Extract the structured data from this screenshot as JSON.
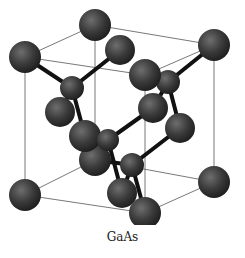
{
  "diagram": {
    "title": "GaAs",
    "type": "crystal-structure",
    "structure": "zinc blende unit cell",
    "colors": {
      "atom": "#3a3a3a",
      "atom_highlight": "#6e6e6e",
      "bond": "#111111",
      "cell_edge": "#555555",
      "background": "#ffffff"
    },
    "cell_edges": [
      [
        25,
        57,
        95,
        25
      ],
      [
        95,
        25,
        214,
        45
      ],
      [
        214,
        45,
        145,
        75
      ],
      [
        25,
        57,
        145,
        75
      ],
      [
        25,
        195,
        145,
        213
      ],
      [
        145,
        213,
        214,
        182
      ],
      [
        214,
        182,
        95,
        160
      ],
      [
        95,
        160,
        25,
        195
      ],
      [
        25,
        57,
        25,
        195
      ],
      [
        95,
        25,
        95,
        160
      ],
      [
        214,
        45,
        214,
        182
      ],
      [
        145,
        75,
        145,
        213
      ]
    ],
    "bonds": [
      [
        25,
        57,
        72,
        88
      ],
      [
        120,
        50,
        72,
        88
      ],
      [
        60,
        112,
        72,
        88
      ],
      [
        85,
        136,
        72,
        88
      ],
      [
        214,
        45,
        168,
        82
      ],
      [
        145,
        75,
        168,
        82
      ],
      [
        180,
        128,
        168,
        82
      ],
      [
        153,
        108,
        168,
        82
      ],
      [
        85,
        136,
        108,
        140
      ],
      [
        153,
        108,
        108,
        140
      ],
      [
        95,
        160,
        108,
        140
      ],
      [
        122,
        193,
        108,
        140
      ],
      [
        180,
        128,
        132,
        165
      ],
      [
        122,
        193,
        132,
        165
      ],
      [
        145,
        213,
        132,
        165
      ],
      [
        95,
        160,
        132,
        165
      ]
    ],
    "atoms": [
      {
        "x": 95,
        "y": 25,
        "r": 16
      },
      {
        "x": 214,
        "y": 45,
        "r": 16
      },
      {
        "x": 25,
        "y": 57,
        "r": 16
      },
      {
        "x": 120,
        "y": 50,
        "r": 15
      },
      {
        "x": 168,
        "y": 82,
        "r": 12
      },
      {
        "x": 72,
        "y": 88,
        "r": 12
      },
      {
        "x": 145,
        "y": 75,
        "r": 16
      },
      {
        "x": 60,
        "y": 112,
        "r": 15
      },
      {
        "x": 153,
        "y": 108,
        "r": 15
      },
      {
        "x": 180,
        "y": 128,
        "r": 15
      },
      {
        "x": 95,
        "y": 160,
        "r": 16
      },
      {
        "x": 85,
        "y": 136,
        "r": 16
      },
      {
        "x": 108,
        "y": 140,
        "r": 11
      },
      {
        "x": 132,
        "y": 165,
        "r": 12
      },
      {
        "x": 122,
        "y": 193,
        "r": 15
      },
      {
        "x": 25,
        "y": 195,
        "r": 16
      },
      {
        "x": 214,
        "y": 182,
        "r": 16
      },
      {
        "x": 145,
        "y": 213,
        "r": 16
      }
    ]
  }
}
